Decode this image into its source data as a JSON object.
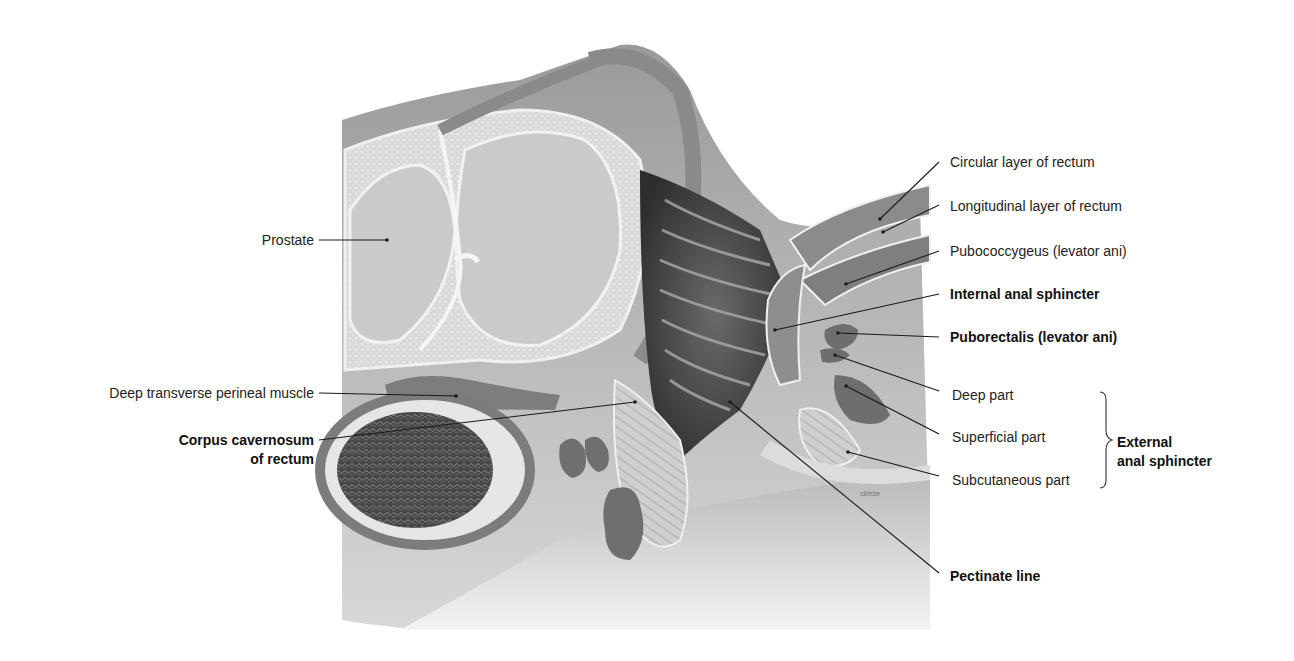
{
  "figure": {
    "colors": {
      "background": "#ffffff",
      "tissue_light": "#e4e4e4",
      "tissue_mid": "#bdbdbd",
      "muscle_dark": "#7a7a7a",
      "cavity_dark": "#3d3d3d",
      "leader_line": "#1a1a1a"
    },
    "signature": "sklebe"
  },
  "labels_left": [
    {
      "id": "prostate",
      "text": "Prostate",
      "bold": false
    },
    {
      "id": "deep-transverse-perineal",
      "text": "Deep transverse perineal muscle",
      "bold": false
    },
    {
      "id": "corpus-cavernosum-1",
      "text": "Corpus cavernosum",
      "bold": true
    },
    {
      "id": "corpus-cavernosum-2",
      "text": "of rectum",
      "bold": true
    }
  ],
  "labels_right": [
    {
      "id": "circular-layer",
      "text": "Circular layer of rectum",
      "bold": false
    },
    {
      "id": "longitudinal-layer",
      "text": "Longitudinal layer of rectum",
      "bold": false
    },
    {
      "id": "pubococcygeus",
      "text": "Pubococcygeus (levator ani)",
      "bold": false
    },
    {
      "id": "internal-sphincter",
      "text": "Internal anal sphincter",
      "bold": true
    },
    {
      "id": "puborectalis",
      "text": "Puborectalis (levator ani)",
      "bold": true
    },
    {
      "id": "deep-part",
      "text": "Deep part",
      "bold": false
    },
    {
      "id": "superficial-part",
      "text": "Superficial part",
      "bold": false
    },
    {
      "id": "subcutaneous-part",
      "text": "Subcutaneous part",
      "bold": false
    },
    {
      "id": "pectinate-line",
      "text": "Pectinate line",
      "bold": true
    }
  ],
  "group_label": {
    "line1": "External",
    "line2": "anal sphincter",
    "members": [
      "Deep part",
      "Superficial part",
      "Subcutaneous part"
    ]
  }
}
